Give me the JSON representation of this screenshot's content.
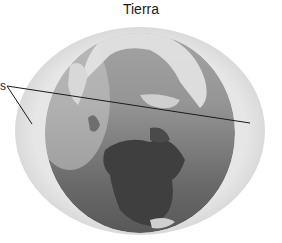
{
  "diagram": {
    "title": "Tierra",
    "label_fragment": "s",
    "colors": {
      "atmosphere": "#e2e2e2",
      "ocean_top": "#9c9c9c",
      "ocean_bottom": "#5a5a5a",
      "land_dark": "#3e3e3e",
      "ice": "#ececec",
      "leader_line": "#1a1a1a"
    }
  }
}
